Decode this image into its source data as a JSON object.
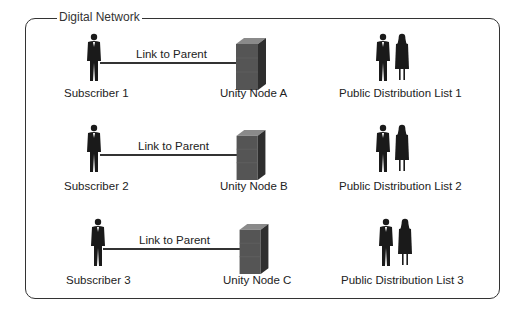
{
  "network": {
    "title": "Digital Network"
  },
  "rows": [
    {
      "subscriber": "Subscriber 1",
      "link": "Link to Parent",
      "node": "Unity Node A",
      "list": "Public Distribution List 1"
    },
    {
      "subscriber": "Subscriber 2",
      "link": "Link to Parent",
      "node": "Unity Node B",
      "list": "Public Distribution List 2"
    },
    {
      "subscriber": "Subscriber 3",
      "link": "Link to Parent",
      "node": "Unity Node C",
      "list": "Public Distribution List 3"
    }
  ],
  "colors": {
    "figure": "#1a1a1a",
    "server_front": "#555555",
    "server_top": "#8a8a8a",
    "server_side": "#2e2e2e",
    "frame": "#333333"
  }
}
